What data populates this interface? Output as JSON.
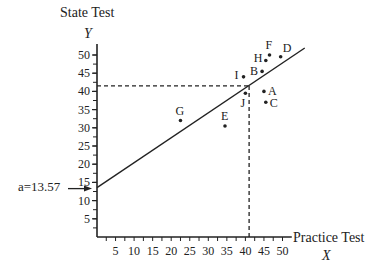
{
  "chart_data": {
    "type": "scatter",
    "title": "",
    "ylabel": "State Test",
    "ylabel_var": "Y",
    "xlabel": "Practice Test",
    "xlabel_var": "X",
    "xlim": [
      0,
      52
    ],
    "ylim": [
      0,
      52
    ],
    "xticks": [
      5,
      10,
      15,
      20,
      25,
      30,
      35,
      40,
      45,
      50
    ],
    "yticks": [
      5,
      10,
      15,
      20,
      25,
      30,
      35,
      40,
      45,
      50
    ],
    "grid": false,
    "points": [
      {
        "label": "F",
        "x": 46.5,
        "y": 50
      },
      {
        "label": "D",
        "x": 49.5,
        "y": 49.5
      },
      {
        "label": "H",
        "x": 45.5,
        "y": 48.5
      },
      {
        "label": "B",
        "x": 44.5,
        "y": 45.5
      },
      {
        "label": "I",
        "x": 39.5,
        "y": 44
      },
      {
        "label": "J",
        "x": 40,
        "y": 39.5
      },
      {
        "label": "A",
        "x": 45,
        "y": 40
      },
      {
        "label": "C",
        "x": 45.5,
        "y": 37
      },
      {
        "label": "E",
        "x": 34.5,
        "y": 30.5
      },
      {
        "label": "G",
        "x": 22.5,
        "y": 32
      }
    ],
    "regression_line": {
      "intercept": 13.57,
      "slope": 0.685,
      "x_start": 0,
      "x_end": 56
    },
    "annotations": [
      {
        "text": "a=13.57",
        "arrow_to": "y-intercept",
        "value": 13.57
      },
      {
        "type": "dashed-guide",
        "x": 41,
        "y": 41.5
      }
    ]
  }
}
